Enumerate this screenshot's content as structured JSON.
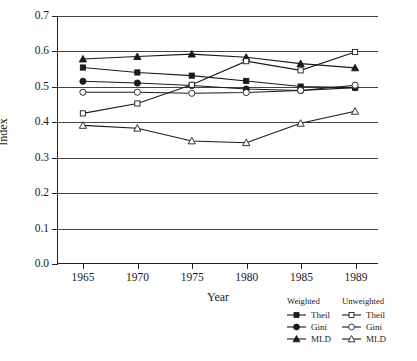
{
  "chart_data": {
    "type": "line",
    "title": "",
    "xlabel": "Year",
    "ylabel": "Index",
    "x": [
      1965,
      1970,
      1975,
      1980,
      1985,
      1989
    ],
    "categories": [
      "1965",
      "1970",
      "1975",
      "1980",
      "1985",
      "1989"
    ],
    "xtick_labels": [
      "1965",
      "1970",
      "1975",
      "1980",
      "1985",
      "1989"
    ],
    "ytick_labels": [
      "0.0",
      "0.1",
      "0.2",
      "0.3",
      "0.4",
      "0.5",
      "0.6",
      "0.7"
    ],
    "ytick_values": [
      0.0,
      0.1,
      0.2,
      0.3,
      0.4,
      0.5,
      0.6,
      0.7
    ],
    "ylim": [
      0.0,
      0.7
    ],
    "grid": "horizontal",
    "legend_position": "below-right",
    "series": [
      {
        "name": "Theil",
        "group": "Weighted",
        "marker": "filled-square",
        "values": [
          0.554,
          0.54,
          0.531,
          0.516,
          0.5,
          0.497
        ]
      },
      {
        "name": "Gini",
        "group": "Weighted",
        "marker": "filled-circle",
        "values": [
          0.515,
          0.51,
          0.503,
          0.493,
          0.489,
          0.497
        ]
      },
      {
        "name": "MLD",
        "group": "Weighted",
        "marker": "filled-triangle",
        "values": [
          0.578,
          0.585,
          0.592,
          0.583,
          0.565,
          0.553
        ]
      },
      {
        "name": "Theil",
        "group": "Unweighted",
        "marker": "open-square",
        "values": [
          0.424,
          0.452,
          0.505,
          0.572,
          0.546,
          0.598
        ]
      },
      {
        "name": "Gini",
        "group": "Unweighted",
        "marker": "open-circle",
        "values": [
          0.484,
          0.484,
          0.481,
          0.483,
          0.489,
          0.504
        ]
      },
      {
        "name": "MLD",
        "group": "Unweighted",
        "marker": "open-triangle",
        "values": [
          0.39,
          0.382,
          0.346,
          0.341,
          0.396,
          0.43
        ]
      }
    ],
    "legend": {
      "columns": [
        {
          "heading": "Weighted",
          "entries": [
            {
              "label": "Theil",
              "marker": "filled-square"
            },
            {
              "label": "Gini",
              "marker": "filled-circle"
            },
            {
              "label": "MLD",
              "marker": "filled-triangle"
            }
          ]
        },
        {
          "heading": "Unweighted",
          "entries": [
            {
              "label": "Theil",
              "marker": "open-square"
            },
            {
              "label": "Gini",
              "marker": "open-circle"
            },
            {
              "label": "MLD",
              "marker": "open-triangle"
            }
          ]
        }
      ]
    },
    "colors": {
      "line": "#1a1a1a",
      "marker_fill": "#1a1a1a",
      "marker_open_fill": "#ffffff",
      "grid": "#444444",
      "axis": "#222222",
      "background": "#ffffff"
    }
  }
}
